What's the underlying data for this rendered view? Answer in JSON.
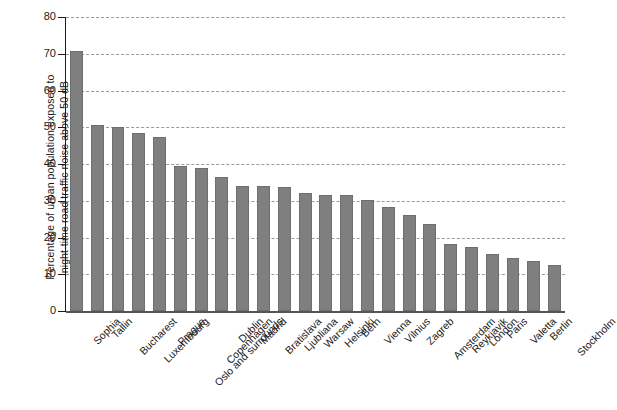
{
  "chart_data": {
    "type": "bar",
    "title": "",
    "xlabel": "",
    "ylabel": "Percentage of urban population exposed to night-time road traffic noise above 50 dB",
    "ylabel_lines": [
      "Percentage of urban population exposed to",
      "night-time road traffic noise above 50 dB"
    ],
    "ylim": [
      0,
      80
    ],
    "yticks": [
      0,
      10,
      20,
      30,
      40,
      50,
      60,
      70,
      80
    ],
    "ytick_labels": [
      "0",
      "10",
      "20",
      "30",
      "40",
      "50",
      "60",
      "70",
      "80"
    ],
    "grid": true,
    "grid_axis": "y",
    "grid_style": "dashed",
    "legend": "none",
    "bar_color": "#7f7f7f",
    "categories": [
      "Sophia",
      "Tallin",
      "Bucharest",
      "Luxembourg",
      "Prague",
      "Oslo and surrounds",
      "Copenhagen",
      "Dublin",
      "Madrid",
      "Bratislava",
      "Ljubliana",
      "Warsaw",
      "Helsinki",
      "Bern",
      "Vienna",
      "Vilnius",
      "Zagreb",
      "Amsterdam",
      "Reykjavik",
      "London",
      "Paris",
      "Valetta",
      "Berlin",
      "Stockholm"
    ],
    "values": [
      70.7,
      50.5,
      50.0,
      48.5,
      47.4,
      39.4,
      38.8,
      36.4,
      34.0,
      33.9,
      33.8,
      32.0,
      31.7,
      31.5,
      30.2,
      28.3,
      26.0,
      23.6,
      18.2,
      17.4,
      15.5,
      14.5,
      13.5,
      12.6
    ]
  }
}
